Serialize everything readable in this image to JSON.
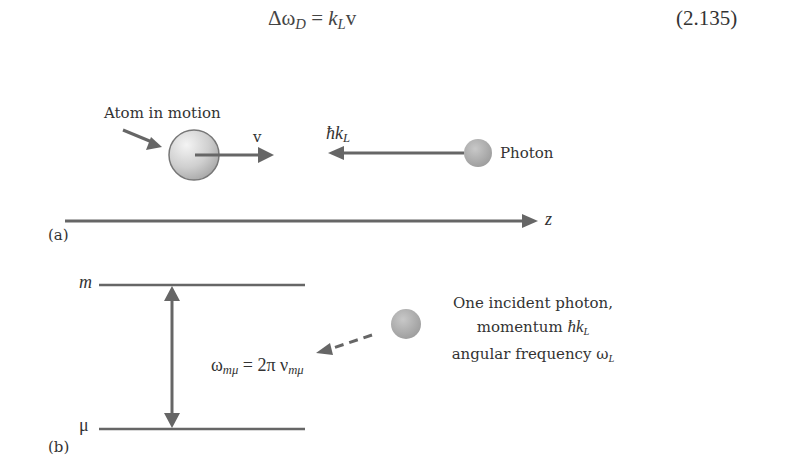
{
  "equation": {
    "lhs_symbol": "Δω",
    "lhs_sub": "D",
    "equals": " = ",
    "rhs_k": "k",
    "rhs_sub": "L",
    "rhs_v": "v",
    "number": "(2.135)"
  },
  "panel_a": {
    "label": "(a)",
    "atom_label": "Atom in motion",
    "velocity_label": "v",
    "momentum_hbar": "ħk",
    "momentum_sub": "L",
    "photon_label": "Photon",
    "axis_label": "z"
  },
  "panel_b": {
    "label": "(b)",
    "upper_level": "m",
    "lower_level": "μ",
    "transition_omega": "ω",
    "transition_omega_sub": "mμ",
    "transition_rhs": " = 2π ν",
    "transition_nu_sub": "mμ",
    "photon_line1": "One incident photon,",
    "photon_line2_text": "momentum ",
    "photon_line2_hbar": "ħk",
    "photon_line2_sub": "L",
    "photon_line3_text": "angular frequency ω",
    "photon_line3_sub": "L"
  },
  "colors": {
    "arrow": "#666666",
    "sphere_light": "#e8e8e8",
    "sphere_dark": "#9a9a9a",
    "text": "#333333"
  }
}
